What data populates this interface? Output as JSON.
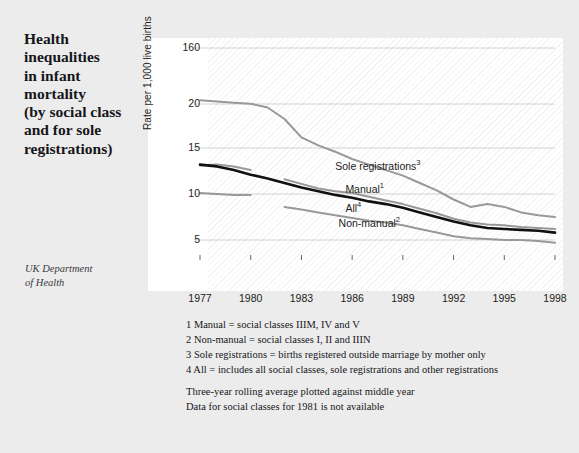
{
  "title": {
    "lines": [
      "Health",
      "inequalities",
      "in infant",
      "mortality",
      "(by social class",
      "and for sole",
      "registrations)"
    ]
  },
  "source": {
    "lines": [
      "UK Department",
      "of Health"
    ]
  },
  "footnotes": [
    "1 Manual = social classes IIIM, IV and V",
    "2 Non-manual = social classes I, II and IIIN",
    "3 Sole registrations = births registered outside marriage by mother only",
    "4 All = includes all social classes, sole registrations and other registrations"
  ],
  "notes": [
    "Three-year rolling average plotted against middle year",
    "Data for social classes for 1981 is not available"
  ],
  "colors": {
    "page_background": "#ececec",
    "plot_background": "#ffffff",
    "gridline": "#cfcfcf",
    "series_all": "#111111",
    "series_grey": "#9a9a9a",
    "text": "#16161a"
  },
  "chart_data": {
    "type": "line",
    "title": "Health inequalities in infant mortality (by social class and for sole registrations)",
    "xlabel": "",
    "ylabel": "Rate per 1,000 live births",
    "grid": true,
    "legend": "inline-labels",
    "xticks": [
      "1977",
      "1980",
      "1983",
      "1986",
      "1989",
      "1992",
      "1995",
      "1998"
    ],
    "yticks": [
      "160",
      "20",
      "15",
      "10",
      "5"
    ],
    "ytick_values": [
      160,
      20,
      15,
      10,
      5
    ],
    "xlim": [
      1977,
      1998
    ],
    "x": [
      1977,
      1978,
      1979,
      1980,
      1981,
      1982,
      1983,
      1984,
      1985,
      1986,
      1987,
      1988,
      1989,
      1990,
      1991,
      1992,
      1993,
      1994,
      1995,
      1996,
      1997,
      1998
    ],
    "series": [
      {
        "name": "Sole registrations",
        "footnote": "3",
        "color": "#9a9a9a",
        "label_x": 1985.0,
        "label_y": 13.1,
        "values": [
          23.0,
          22.0,
          21.0,
          20.2,
          19.6,
          18.3,
          16.2,
          15.3,
          14.6,
          13.8,
          13.2,
          12.6,
          12.0,
          11.2,
          10.4,
          9.4,
          8.6,
          8.9,
          8.6,
          8.0,
          7.7,
          7.5
        ]
      },
      {
        "name": "Manual",
        "footnote": "1",
        "color": "#9a9a9a",
        "label_x": 1985.6,
        "label_y": 10.6,
        "values": [
          13.1,
          13.2,
          13.0,
          12.6,
          null,
          11.6,
          11.1,
          10.6,
          10.3,
          10.1,
          9.7,
          9.3,
          8.9,
          8.4,
          7.9,
          7.3,
          6.9,
          6.7,
          6.6,
          6.4,
          6.3,
          6.2
        ]
      },
      {
        "name": "All",
        "footnote": "4",
        "color": "#111111",
        "label_x": 1985.6,
        "label_y": 8.6,
        "values": [
          13.2,
          13.0,
          12.6,
          12.1,
          11.7,
          11.2,
          10.7,
          10.3,
          9.9,
          9.6,
          9.2,
          8.9,
          8.5,
          8.0,
          7.5,
          7.0,
          6.6,
          6.3,
          6.2,
          6.1,
          6.0,
          5.8
        ]
      },
      {
        "name": "Non-manual",
        "footnote": "2",
        "color": "#9a9a9a",
        "label_x": 1985.2,
        "label_y": 7.0,
        "values": [
          10.1,
          10.0,
          9.9,
          9.9,
          null,
          8.6,
          8.3,
          8.0,
          7.7,
          7.4,
          7.1,
          6.9,
          6.6,
          6.2,
          5.8,
          5.4,
          5.2,
          5.1,
          5.0,
          5.0,
          4.9,
          4.7
        ]
      }
    ]
  }
}
